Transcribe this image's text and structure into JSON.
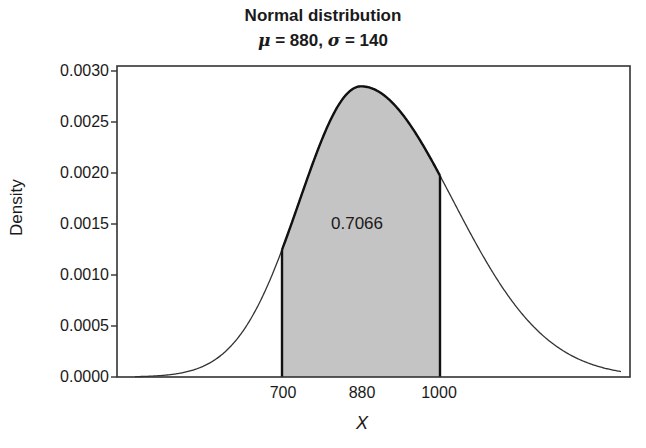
{
  "title": {
    "line1": "Normal distribution",
    "mu_symbol": "μ",
    "mu_text": " = 880, ",
    "sigma_symbol": "σ",
    "sigma_text": " = 140"
  },
  "axes": {
    "ylabel": "Density",
    "xlabel": "X",
    "yticks": [
      "0.0030",
      "0.0025",
      "0.0020",
      "0.0015",
      "0.0010",
      "0.0005",
      "0.0000"
    ],
    "xticks": [
      "700",
      "880",
      "1000"
    ]
  },
  "annotation": "0.7066",
  "colors": {
    "shade": "#c4c4c4",
    "line": "#222222"
  },
  "chart_data": {
    "type": "area",
    "xlabel": "X",
    "ylabel": "Density",
    "distribution": {
      "name": "normal",
      "mean": 880,
      "sd": 140
    },
    "shaded_region": {
      "from": 700,
      "to": 1000,
      "probability": 0.7066
    },
    "x_ticks": [
      700,
      880,
      1000
    ],
    "y_ticks": [
      0.0,
      0.0005,
      0.001,
      0.0015,
      0.002,
      0.0025,
      0.003
    ],
    "ylim": [
      0,
      0.003
    ],
    "peak_density": 0.00285,
    "density_at_700": 0.00125,
    "density_at_1000": 0.00198,
    "grid": false,
    "legend": false
  }
}
